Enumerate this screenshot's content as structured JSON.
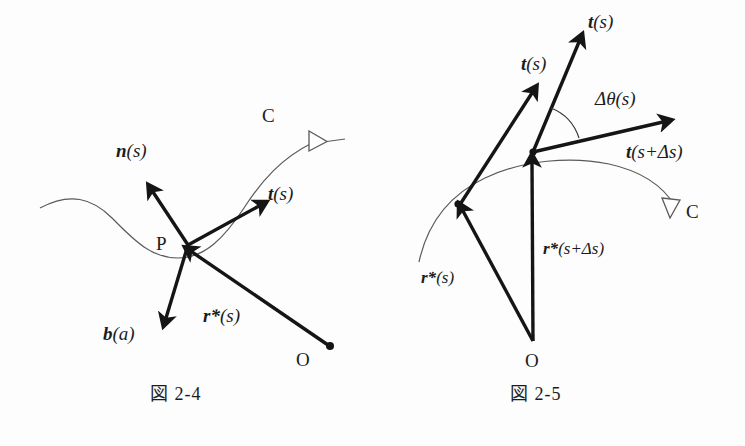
{
  "page": {
    "background_color": "#fdfdfd",
    "ink_color": "#1c1c1c",
    "curve_color": "#5a5a5a",
    "width": 745,
    "height": 446
  },
  "figures": [
    {
      "id": "fig-2-4",
      "caption": "図 2-4",
      "caption_kanji": "図",
      "caption_number": "2-4",
      "curve_label": "C",
      "point_labels": {
        "curve_point": "P",
        "origin": "O"
      },
      "vectors": [
        {
          "name": "normal-vector",
          "label_bold": "n",
          "label_rest": "(s)",
          "label_full": "n(s)"
        },
        {
          "name": "tangent-vector",
          "label_bold": "t",
          "label_rest": "(s)",
          "label_full": "t(s)"
        },
        {
          "name": "binormal-vector",
          "label_bold": "b",
          "label_rest": "(a)",
          "label_full": "b(a)"
        },
        {
          "name": "position-vector",
          "label_bold": "r*",
          "label_rest": "(s)",
          "label_full": "r*(s)"
        }
      ]
    },
    {
      "id": "fig-2-5",
      "caption": "図 2-5",
      "caption_kanji": "図",
      "caption_number": "2-5",
      "curve_label": "C",
      "point_labels": {
        "origin": "O"
      },
      "angle_label": "Δθ(s)",
      "angle_label_delta": "Δθ",
      "angle_label_rest": "(s)",
      "vectors": [
        {
          "name": "tangent-vector-translated",
          "label_bold": "t",
          "label_rest": "(s)",
          "label_full": "t(s)"
        },
        {
          "name": "tangent-vector-at-s",
          "label_bold": "t",
          "label_rest": "(s)",
          "label_full": "t(s)"
        },
        {
          "name": "tangent-vector-at-s-plus",
          "label_bold": "t",
          "label_rest": "(s+Δs)",
          "label_full": "t(s+Δs)"
        },
        {
          "name": "position-vector-s",
          "label_bold": "r*",
          "label_rest": "(s)",
          "label_full": "r*(s)"
        },
        {
          "name": "position-vector-s-plus",
          "label_bold": "r*",
          "label_rest": "(s+Δs)",
          "label_full": "r*(s+Δs)"
        }
      ]
    }
  ]
}
